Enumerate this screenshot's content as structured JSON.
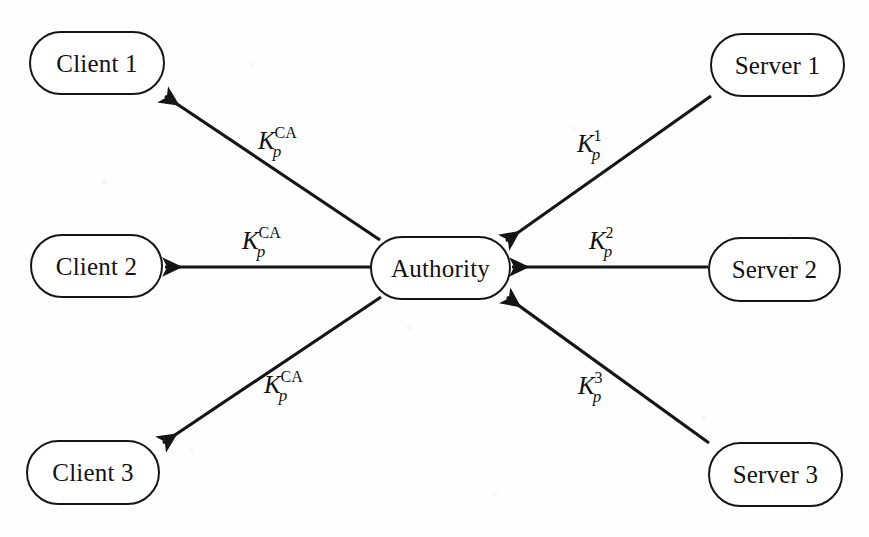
{
  "figure": {
    "background_color": "#fefefe",
    "stroke_color": "#151515",
    "text_color": "#111111",
    "width": 869,
    "height": 537
  },
  "nodes": [
    {
      "id": "client1",
      "label": "Client 1",
      "x": 29,
      "y": 31,
      "w": 136,
      "h": 64
    },
    {
      "id": "client2",
      "label": "Client 2",
      "x": 30,
      "y": 234,
      "w": 133,
      "h": 64
    },
    {
      "id": "client3",
      "label": "Client 3",
      "x": 26,
      "y": 440,
      "w": 134,
      "h": 65
    },
    {
      "id": "authority",
      "label": "Authority",
      "x": 370,
      "y": 236,
      "w": 141,
      "h": 64
    },
    {
      "id": "server1",
      "label": "Server 1",
      "x": 710,
      "y": 33,
      "w": 135,
      "h": 64
    },
    {
      "id": "server2",
      "label": "Server 2",
      "x": 708,
      "y": 237,
      "w": 133,
      "h": 65
    },
    {
      "id": "server3",
      "label": "Server 3",
      "x": 708,
      "y": 442,
      "w": 135,
      "h": 65
    }
  ],
  "edges": [
    {
      "id": "authority-to-client1",
      "from": "authority",
      "to": "client1",
      "direction": "to-client",
      "x1": 380,
      "y1": 240,
      "x2": 165,
      "y2": 96
    },
    {
      "id": "authority-to-client2",
      "from": "authority",
      "to": "client2",
      "direction": "to-client",
      "x1": 370,
      "y1": 267,
      "x2": 165,
      "y2": 267
    },
    {
      "id": "authority-to-client3",
      "from": "authority",
      "to": "client3",
      "direction": "to-client",
      "x1": 381,
      "y1": 297,
      "x2": 163,
      "y2": 443
    },
    {
      "id": "server1-to-authority",
      "from": "server1",
      "to": "authority",
      "direction": "to-authority",
      "x1": 711,
      "y1": 96,
      "x2": 506,
      "y2": 241
    },
    {
      "id": "server2-to-authority",
      "from": "server2",
      "to": "authority",
      "direction": "to-authority",
      "x1": 708,
      "y1": 267,
      "x2": 512,
      "y2": 267
    },
    {
      "id": "server3-to-authority",
      "from": "server3",
      "to": "authority",
      "direction": "to-authority",
      "x1": 709,
      "y1": 443,
      "x2": 507,
      "y2": 297
    }
  ],
  "edge_labels": [
    {
      "id": "label-client1",
      "edge": "authority-to-client1",
      "key": "K",
      "superscript": "CA",
      "subscript": "p",
      "superscript_style": "roman",
      "text": "K_p^CA",
      "x": 258,
      "y": 128
    },
    {
      "id": "label-client2",
      "edge": "authority-to-client2",
      "key": "K",
      "superscript": "CA",
      "subscript": "p",
      "superscript_style": "roman",
      "text": "K_p^CA",
      "x": 242,
      "y": 228
    },
    {
      "id": "label-client3",
      "edge": "authority-to-client3",
      "key": "K",
      "superscript": "CA",
      "subscript": "p",
      "superscript_style": "roman",
      "text": "K_p^CA",
      "x": 264,
      "y": 372
    },
    {
      "id": "label-server1",
      "edge": "server1-to-authority",
      "key": "K",
      "superscript": "1",
      "subscript": "p",
      "superscript_style": "roman",
      "text": "K_p^1",
      "x": 577,
      "y": 131
    },
    {
      "id": "label-server2",
      "edge": "server2-to-authority",
      "key": "K",
      "superscript": "2",
      "subscript": "p",
      "superscript_style": "roman",
      "text": "K_p^2",
      "x": 589,
      "y": 228
    },
    {
      "id": "label-server3",
      "edge": "server3-to-authority",
      "key": "K",
      "superscript": "3",
      "subscript": "p",
      "superscript_style": "roman",
      "text": "K_p^3",
      "x": 578,
      "y": 373
    }
  ]
}
